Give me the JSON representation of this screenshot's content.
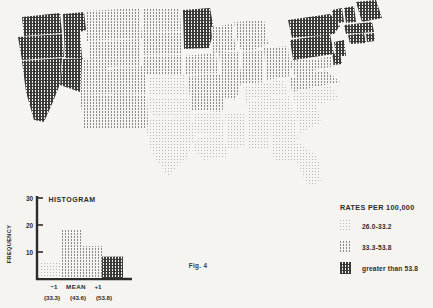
{
  "figure": {
    "caption": "Fig. 4",
    "background_color": "#f5f4f0",
    "ink_color": "#2b2b2b"
  },
  "legend": {
    "title": "RATES PER 100,000",
    "items": [
      {
        "label": "26.0-33.2",
        "density": "low",
        "swatch": "hatch-light"
      },
      {
        "label": "33.3-53.8",
        "density": "medium",
        "swatch": "hatch-medium"
      },
      {
        "label": "greater than 53.8",
        "density": "high",
        "swatch": "hatch-dark"
      }
    ]
  },
  "histogram": {
    "title": "HISTOGRAM",
    "ylabel": "FREQUENCY",
    "axis_ticks": [
      "10",
      "20",
      "30"
    ],
    "x_marks": [
      "−1",
      "MEAN",
      "+1"
    ],
    "x_values": [
      "(33.3)",
      "(43.6)",
      "(53.8)"
    ]
  },
  "chart_data": [
    {
      "type": "bar",
      "title": "HISTOGRAM",
      "xlabel": "",
      "ylabel": "FREQUENCY",
      "categories": [
        "bin1",
        "bin2",
        "bin3",
        "bin4"
      ],
      "values": [
        6,
        18,
        12,
        8
      ],
      "ylim": [
        0,
        30
      ],
      "yticks": [
        10,
        20,
        30
      ],
      "grid": false,
      "legend": "none",
      "annotations": [
        {
          "text": "−1",
          "value": "(33.3)",
          "x_position": 0.33
        },
        {
          "text": "MEAN",
          "value": "(43.6)",
          "x_position": 0.55
        },
        {
          "text": "+1",
          "value": "(53.8)",
          "x_position": 0.76
        }
      ],
      "bar_fills": [
        "hatch-light",
        "hatch-medium",
        "hatch-medium",
        "hatch-dark"
      ]
    },
    {
      "type": "heatmap",
      "title": "",
      "subtitle": "United States choropleth of rates per 100,000",
      "classes": [
        {
          "label": "26.0-33.2",
          "fill": "hatch-light"
        },
        {
          "label": "33.3-53.8",
          "fill": "hatch-medium"
        },
        {
          "label": "greater than 53.8",
          "fill": "hatch-dark"
        }
      ],
      "regions": [
        {
          "name": "Washington",
          "class": 2
        },
        {
          "name": "Oregon",
          "class": 2
        },
        {
          "name": "Idaho",
          "class": 2
        },
        {
          "name": "Montana",
          "class": 1
        },
        {
          "name": "Wyoming",
          "class": 1
        },
        {
          "name": "Nevada",
          "class": 2
        },
        {
          "name": "California",
          "class": 2
        },
        {
          "name": "Utah",
          "class": 1
        },
        {
          "name": "Colorado",
          "class": 1
        },
        {
          "name": "Arizona",
          "class": 1
        },
        {
          "name": "New Mexico",
          "class": 1
        },
        {
          "name": "North Dakota",
          "class": 1
        },
        {
          "name": "South Dakota",
          "class": 1
        },
        {
          "name": "Nebraska",
          "class": 1
        },
        {
          "name": "Kansas",
          "class": 0
        },
        {
          "name": "Oklahoma",
          "class": 0
        },
        {
          "name": "Texas",
          "class": 0
        },
        {
          "name": "Minnesota",
          "class": 2
        },
        {
          "name": "Iowa",
          "class": 1
        },
        {
          "name": "Missouri",
          "class": 1
        },
        {
          "name": "Arkansas",
          "class": 0
        },
        {
          "name": "Louisiana",
          "class": 0
        },
        {
          "name": "Wisconsin",
          "class": 1
        },
        {
          "name": "Illinois",
          "class": 1
        },
        {
          "name": "Mississippi",
          "class": 0
        },
        {
          "name": "Michigan",
          "class": 1
        },
        {
          "name": "Indiana",
          "class": 1
        },
        {
          "name": "Ohio",
          "class": 1
        },
        {
          "name": "Kentucky",
          "class": 0
        },
        {
          "name": "Tennessee",
          "class": 0
        },
        {
          "name": "Alabama",
          "class": 0
        },
        {
          "name": "Georgia",
          "class": 0
        },
        {
          "name": "Florida",
          "class": 0
        },
        {
          "name": "South Carolina",
          "class": 0
        },
        {
          "name": "North Carolina",
          "class": 0
        },
        {
          "name": "Virginia",
          "class": 1
        },
        {
          "name": "West Virginia",
          "class": 1
        },
        {
          "name": "Pennsylvania",
          "class": 2
        },
        {
          "name": "New York",
          "class": 2
        },
        {
          "name": "Vermont",
          "class": 2
        },
        {
          "name": "New Hampshire",
          "class": 2
        },
        {
          "name": "Maine",
          "class": 2
        },
        {
          "name": "Massachusetts",
          "class": 2
        },
        {
          "name": "Rhode Island",
          "class": 2
        },
        {
          "name": "Connecticut",
          "class": 2
        },
        {
          "name": "New Jersey",
          "class": 2
        },
        {
          "name": "Delaware",
          "class": 2
        },
        {
          "name": "Maryland",
          "class": 1
        }
      ]
    }
  ]
}
